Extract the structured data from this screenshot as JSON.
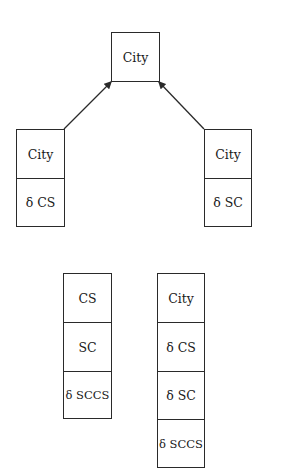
{
  "diagram": {
    "top": {
      "cells": [
        "City"
      ]
    },
    "left": {
      "cells": [
        "City",
        "δ CS"
      ]
    },
    "right": {
      "cells": [
        "City",
        "δ SC"
      ]
    },
    "bottom_left": {
      "cells": [
        "CS",
        "SC",
        "δ SCCS"
      ]
    },
    "bottom_right": {
      "cells": [
        "City",
        "δ CS",
        "δ SC",
        "δ SCCS"
      ]
    },
    "edges": [
      {
        "from": "left",
        "to": "top"
      },
      {
        "from": "right",
        "to": "top"
      }
    ]
  }
}
